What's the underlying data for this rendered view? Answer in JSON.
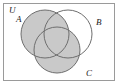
{
  "figure": {
    "name": "venn-diagram-three-sets",
    "kind": "venn",
    "background_color": "#ffffff",
    "universe": {
      "label": "U",
      "label_x": 9,
      "label_y": 13,
      "rect": {
        "x": 3,
        "y": 3,
        "width": 111,
        "height": 77
      },
      "border_color": "#9a9a9a",
      "border_width": 1,
      "fill_color": "#ffffff"
    },
    "sets": [
      {
        "id": "A",
        "label": "A",
        "label_x": 16,
        "label_y": 22,
        "cx": 45,
        "cy": 34,
        "r": 24,
        "shaded": true
      },
      {
        "id": "B",
        "label": "B",
        "label_x": 96,
        "label_y": 25,
        "cx": 68,
        "cy": 34,
        "r": 24,
        "shaded": false
      },
      {
        "id": "C",
        "label": "C",
        "label_x": 86,
        "label_y": 76,
        "cx": 57,
        "cy": 50,
        "r": 23,
        "shaded": true
      }
    ],
    "shading": {
      "description": "A union C",
      "fill_color": "#c9c9c9",
      "fill_opacity": 1,
      "stroke_color": "#6e6e6e",
      "stroke_width": 1
    },
    "circle_stroke_color": "#6e6e6e",
    "circle_stroke_width": 1,
    "unshaded_fill": "#ffffff"
  }
}
